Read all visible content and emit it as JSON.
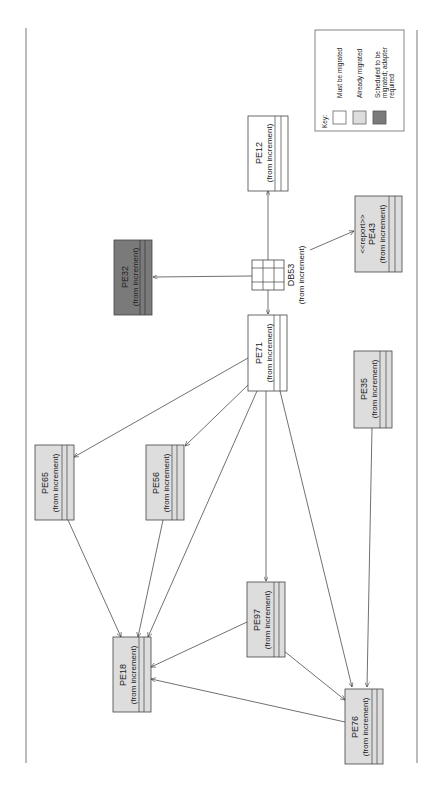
{
  "diagram": {
    "orientation": "rotated-90-clockwise",
    "colors": {
      "must_migrate": "#ffffff",
      "already_migrated": "#dddddd",
      "scheduled_adapter": "#7a7a7a",
      "stroke": "#444444"
    },
    "legend": {
      "title": "Key:",
      "items": [
        {
          "label": "Must be migrated",
          "fill": "#ffffff"
        },
        {
          "label": "Already migrated",
          "fill": "#dddddd"
        },
        {
          "label_lines": [
            "Scheduled to be",
            "migrated; adapter",
            "required"
          ],
          "fill": "#7a7a7a"
        }
      ]
    },
    "nodes": {
      "PE12": {
        "name": "PE12",
        "sub": "(from increment)",
        "status": "must_migrate"
      },
      "DB53": {
        "name": "DB53",
        "sub": "(from increment)",
        "kind": "component"
      },
      "PE32": {
        "name": "PE32",
        "sub": "(from increment)",
        "status": "scheduled_adapter"
      },
      "PE43": {
        "stereotype": "<<report>>",
        "name": "PE43",
        "sub": "(from increment)",
        "status": "already_migrated"
      },
      "PE71": {
        "name": "PE71",
        "sub": "(from increment)",
        "status": "must_migrate"
      },
      "PE35": {
        "name": "PE35",
        "sub": "(from increment)",
        "status": "already_migrated"
      },
      "PE65": {
        "name": "PE65",
        "sub": "(from increment)",
        "status": "already_migrated"
      },
      "PE56": {
        "name": "PE56",
        "sub": "(from increment)",
        "status": "already_migrated"
      },
      "PE97": {
        "name": "PE97",
        "sub": "(from increment)",
        "status": "already_migrated"
      },
      "PE18": {
        "name": "PE18",
        "sub": "(from increment)",
        "status": "already_migrated"
      },
      "PE76": {
        "name": "PE76",
        "sub": "(from increment)",
        "status": "already_migrated"
      }
    },
    "edges": [
      {
        "from": "DB53",
        "to": "PE12"
      },
      {
        "from": "DB53",
        "to": "PE32"
      },
      {
        "from": "DB53",
        "to": "PE71"
      },
      {
        "from": "DB53",
        "to": "PE43"
      },
      {
        "from": "PE71",
        "to": "PE65"
      },
      {
        "from": "PE71",
        "to": "PE56"
      },
      {
        "from": "PE71",
        "to": "PE18"
      },
      {
        "from": "PE71",
        "to": "PE97"
      },
      {
        "from": "PE71",
        "to": "PE76"
      },
      {
        "from": "PE65",
        "to": "PE18"
      },
      {
        "from": "PE56",
        "to": "PE18"
      },
      {
        "from": "PE97",
        "to": "PE18"
      },
      {
        "from": "PE97",
        "to": "PE76"
      },
      {
        "from": "PE76",
        "to": "PE18"
      },
      {
        "from": "PE35",
        "to": "PE76"
      }
    ]
  }
}
